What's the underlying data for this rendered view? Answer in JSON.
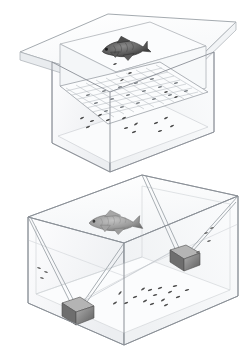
{
  "figure": {
    "background_color": "#ffffff",
    "width": 248,
    "height": 359,
    "style": "technical line drawing / isometric illustration",
    "panel_count": 2
  },
  "colors": {
    "outline": "#8a8f96",
    "outline_light": "#b9bec4",
    "glass_fill": "#fcfdfd",
    "glass_shade": "#f1f3f5",
    "glass_shade_dark": "#e7eaed",
    "fish_upper": "#6e6e6e",
    "fish_upper_dark": "#3e3e3e",
    "fish_lower": "#9a9a9a",
    "fish_lower_dark": "#6a6a6a",
    "weight_block": "#8d8d8d",
    "weight_block_dark": "#5e5e5e",
    "weight_block_light": "#b4b4b4",
    "fry": "#555555",
    "thread": "#9aa0a6"
  },
  "panels": [
    {
      "id": "panel-upper",
      "name": "upper-assembly-view",
      "description": "Isometric cut-away of a rectangular transparent tank containing a removable perforated spawning tray with flared lip; adult fish rests on the tray surface and fry/eggs fall through to the tank floor below.",
      "components": [
        {
          "name": "outer-tank",
          "label": "transparent rectangular tank"
        },
        {
          "name": "spawning-tray",
          "label": "removable perforated tray with flared rim"
        },
        {
          "name": "tray-grid",
          "label": "slotted egg-separation grid"
        },
        {
          "name": "adult-fish",
          "label": "adult spawning fish",
          "orientation": "facing left"
        },
        {
          "name": "fry-cluster",
          "label": "eggs / fry settled on tank floor"
        }
      ],
      "fry_count": 18
    },
    {
      "id": "panel-lower",
      "name": "lower-tank-view",
      "description": "Isometric view of a transparent rectangular aquarium with a fine mesh net suspended diagonally from the upper corners and anchored by two dark weight blocks on the tank floor; adult fish swims above the mesh and eggs lie scattered on the substrate.",
      "components": [
        {
          "name": "aquarium",
          "label": "transparent rectangular aquarium"
        },
        {
          "name": "suspended-mesh",
          "label": "fine mesh net suspended from top corners"
        },
        {
          "name": "weight-block-left",
          "label": "anchor weight block (front-left)"
        },
        {
          "name": "weight-block-right",
          "label": "anchor weight block (mid-right)"
        },
        {
          "name": "adult-fish",
          "label": "adult spawning fish",
          "orientation": "facing left"
        },
        {
          "name": "egg-cluster",
          "label": "eggs scattered on tank floor"
        }
      ],
      "weight_block_count": 2,
      "egg_count": 22
    }
  ],
  "annotations": {
    "caption": ""
  }
}
